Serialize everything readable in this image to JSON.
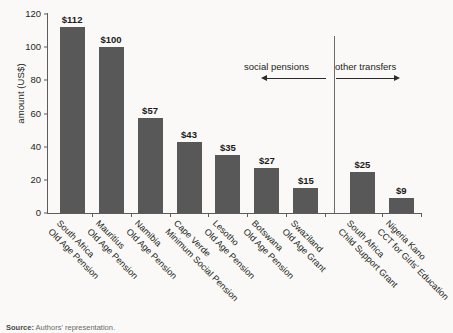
{
  "chart_data": {
    "type": "bar",
    "title": "",
    "xlabel": "",
    "ylabel": "amount (US$)",
    "ylim": [
      0,
      120
    ],
    "yticks": [
      0,
      20,
      40,
      60,
      80,
      100,
      120
    ],
    "grid": false,
    "legend": "none",
    "bar_color": "#585858",
    "categories": [
      {
        "line1": "South Africa",
        "line2": "Old Age Pension"
      },
      {
        "line1": "Mauritius",
        "line2": "Old Age Pension"
      },
      {
        "line1": "Namibia",
        "line2": "Old Age Pension"
      },
      {
        "line1": "Cape Verde",
        "line2": "Minimum Social Pension"
      },
      {
        "line1": "Lesotho",
        "line2": "Old Age Pension"
      },
      {
        "line1": "Botswana",
        "line2": "Old Age Pension"
      },
      {
        "line1": "Swaziland",
        "line2": "Old Age Grant"
      },
      {
        "line1": "South Africa",
        "line2": "Child Support Grant"
      },
      {
        "line1": "Nigeria Kano",
        "line2": "CCT for Girls' Education"
      }
    ],
    "values": [
      112,
      100,
      57,
      43,
      35,
      27,
      15,
      25,
      9
    ],
    "value_labels": [
      "$112",
      "$100",
      "$57",
      "$43",
      "$35",
      "$27",
      "$15",
      "$25",
      "$9"
    ],
    "annotations": [
      {
        "text": "social pensions",
        "arrow": "left",
        "group_categories": 7
      },
      {
        "text": "other transfers",
        "arrow": "right",
        "group_categories": 2
      }
    ]
  },
  "source": {
    "prefix": "Source:",
    "text": "Authors' representation."
  }
}
